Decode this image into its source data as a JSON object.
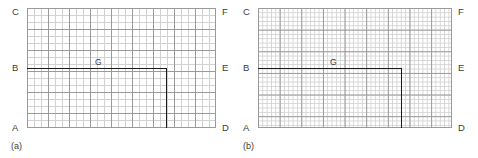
{
  "figure": {
    "background_color": "#ffffff",
    "grid_line_color": "#9a9a9a",
    "grid_minor_color": "#d2d2d2",
    "path_color": "#1a1a1a",
    "label_color": "#3b3b3b"
  },
  "panels": [
    {
      "id": "a",
      "caption": "(a)",
      "grid": {
        "cell_px": 7.0,
        "columns": 27,
        "rows": 17,
        "major_every": 3
      },
      "corner_labels": {
        "top_left": "C",
        "top_right": "F",
        "mid_left": "B",
        "mid_right": "E",
        "bottom_left": "A",
        "bottom_right": "D"
      },
      "interior_label": "G",
      "path": {
        "start_label": "B",
        "corner_label": "G",
        "end_label": "D"
      }
    },
    {
      "id": "b",
      "caption": "(b)",
      "grid": {
        "cell_px": 4.33,
        "columns": 45,
        "rows": 28,
        "major_every": 5
      },
      "corner_labels": {
        "top_left": "C",
        "top_right": "F",
        "mid_left": "B",
        "mid_right": "E",
        "bottom_left": "A",
        "bottom_right": "D"
      },
      "interior_label": "G",
      "path": {
        "start_label": "B",
        "corner_label": "G",
        "end_label": "D"
      }
    }
  ]
}
